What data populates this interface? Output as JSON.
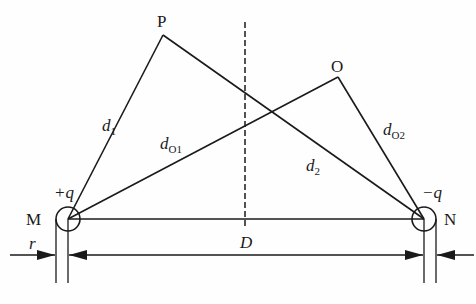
{
  "diagram": {
    "title": "",
    "points": {
      "P": {
        "label": "P",
        "x": 163,
        "y": 35
      },
      "O": {
        "label": "O",
        "x": 338,
        "y": 77
      },
      "M": {
        "label": "M",
        "x": 68,
        "y": 219
      },
      "N": {
        "label": "N",
        "x": 424,
        "y": 219
      }
    },
    "charges": {
      "M": {
        "label": "+q"
      },
      "N": {
        "label": "−q"
      }
    },
    "segments": {
      "d1": {
        "main": "d",
        "sub": "1",
        "from": "M",
        "to": "P"
      },
      "d2": {
        "main": "d",
        "sub": "2",
        "from": "P",
        "to": "N"
      },
      "dO1": {
        "main": "d",
        "sub": "O1",
        "from": "M",
        "to": "O"
      },
      "dO2": {
        "main": "d",
        "sub": "O2",
        "from": "O",
        "to": "N"
      }
    },
    "dimensions": {
      "D": {
        "label": "D"
      },
      "r": {
        "label": "r"
      }
    },
    "symmetry_axis": {
      "style": "dashed",
      "x": 245
    }
  }
}
